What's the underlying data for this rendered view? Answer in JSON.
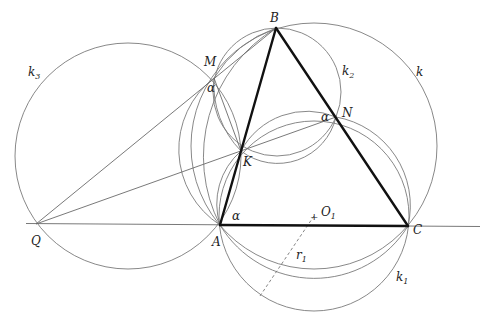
{
  "figure": {
    "points": [
      {
        "name": "B",
        "x": 276,
        "y": 28,
        "lx": 270,
        "ly": 22
      },
      {
        "name": "M",
        "x": 214,
        "y": 78,
        "lx": 204,
        "ly": 65
      },
      {
        "name": "N",
        "x": 336,
        "y": 117,
        "lx": 342,
        "ly": 117
      },
      {
        "name": "K",
        "x": 241,
        "y": 151,
        "lx": 243,
        "ly": 166
      },
      {
        "name": "A",
        "x": 220,
        "y": 225,
        "lx": 211,
        "ly": 245
      },
      {
        "name": "C",
        "x": 408,
        "y": 226,
        "lx": 413,
        "ly": 234
      },
      {
        "name": "Q",
        "x": 36,
        "y": 224,
        "lx": 31,
        "ly": 244
      }
    ],
    "labels": {
      "k": "k",
      "k1": "k",
      "k1_sub": "1",
      "k2": "k",
      "k2_sub": "2",
      "k3": "k",
      "k3_sub": "3",
      "O1": "O",
      "O1_sub": "1",
      "r1": "r",
      "r1_sub": "1",
      "alpha_M": "α",
      "alpha_N": "α",
      "alpha_A": "α"
    }
  }
}
